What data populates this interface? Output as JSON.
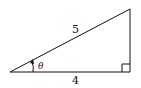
{
  "diagram": {
    "type": "right-triangle",
    "hypotenuse_label": "5",
    "adjacent_label": "4",
    "angle_label": "θ",
    "right_angle_marker": true,
    "stroke_color": "#111111"
  }
}
